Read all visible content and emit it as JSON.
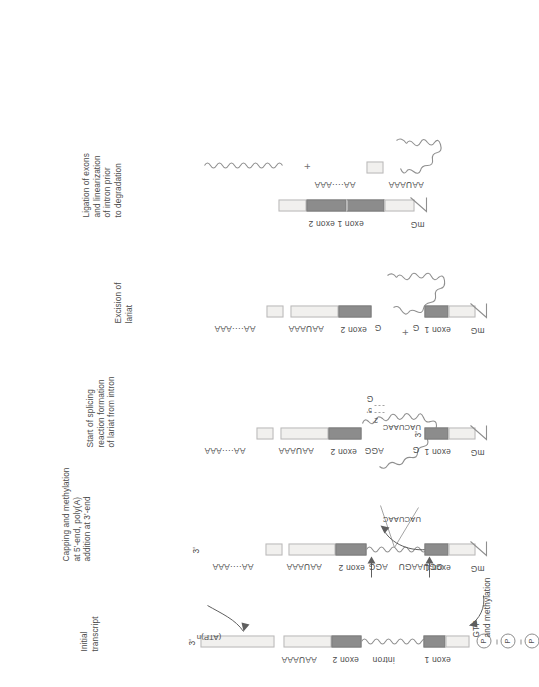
{
  "figure": {
    "colors": {
      "exon": "#8c8c8c",
      "utr": "#f1f0ee",
      "stroke": "#8f8f8f",
      "text": "#4a4a4a"
    }
  },
  "stages": [
    {
      "id": "initial-transcript",
      "caption": "Initial\ntranscript",
      "labels": {
        "three_prime": "3'",
        "aauaaa": "AAUAAA",
        "exon2": "exon 2",
        "intron": "intron",
        "exon1": "exon 1",
        "p1": "P",
        "p2": "P",
        "p3": "P"
      }
    },
    {
      "id": "capping-polyadenylation",
      "caption": "Capping and methylation\nat 5'-end, poly(A)\naddition at 3'-end",
      "labels": {
        "atp": "(ATP)n",
        "three_prime": "3'",
        "polya": "AA····AAA",
        "aauaaa": "AAUAAA",
        "exon2": "exon 2",
        "agg": "AGG",
        "uacuaac": "UACUAAC",
        "gguaagu": "GGUAAGU",
        "exon1": "exon 1",
        "mg": "mG",
        "gtp_note": "GTP\nand methylation"
      }
    },
    {
      "id": "start-of-splicing",
      "caption": "Start of splicing\nreaction formation\nof lariat from intron",
      "labels": {
        "polya": "AA····AAA",
        "aauaaa": "AAUAAA",
        "exon2": "exon 2",
        "agg": "AGG",
        "g5": "G",
        "five_prime": "5'",
        "two_prime": "2'",
        "uacuaac": "UACUAAC",
        "exon1": "exon 1",
        "g3": "G",
        "three_prime": "3'",
        "mg": "mG"
      }
    },
    {
      "id": "excision-of-lariat",
      "caption": "Excision of\nlariat",
      "labels": {
        "polya": "AA····AAA",
        "aauaaa": "AAUAAA",
        "exon2": "exon 2",
        "g_exon2": "G",
        "plus": "+",
        "exon1": "exon 1",
        "g_exon1": "G",
        "mg": "mG"
      }
    },
    {
      "id": "ligation-of-exons",
      "caption": "Ligation of exons\nand linearization\nof intron prior\nto degradation",
      "labels": {
        "polya": "AA····AAA",
        "aauaaa": "AAUAAA",
        "plus": "+",
        "exon1_exon2": "exon 1 exon 2",
        "mg": "mG"
      }
    }
  ]
}
